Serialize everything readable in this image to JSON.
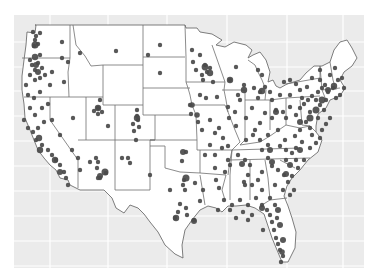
{
  "figure": {
    "type": "dot-density map",
    "region": "Contiguous United States",
    "background_color": "#ebebeb",
    "gridline_color": "#ffffff",
    "land_color": "#ffffff",
    "border_color": "#6e6e6e",
    "point_color": "#4a4a4a",
    "panel": {
      "x": 14,
      "y": 15,
      "width": 350,
      "height": 253
    },
    "grid_x": [
      50,
      108,
      167,
      227,
      287,
      343
    ],
    "grid_y": [
      42,
      67,
      91,
      116,
      141,
      166,
      191,
      216,
      241,
      266
    ]
  },
  "points": [
    [
      33,
      32
    ],
    [
      36,
      36
    ],
    [
      35,
      40
    ],
    [
      38,
      44
    ],
    [
      34,
      46
    ],
    [
      40,
      33
    ],
    [
      62,
      42
    ],
    [
      40,
      55
    ],
    [
      30,
      60
    ],
    [
      32,
      65
    ],
    [
      35,
      70
    ],
    [
      38,
      63
    ],
    [
      42,
      68
    ],
    [
      30,
      75
    ],
    [
      35,
      80
    ],
    [
      40,
      78
    ],
    [
      45,
      75
    ],
    [
      52,
      72
    ],
    [
      50,
      85
    ],
    [
      64,
      82
    ],
    [
      68,
      62
    ],
    [
      80,
      53
    ],
    [
      116,
      51
    ],
    [
      160,
      45
    ],
    [
      62,
      58
    ],
    [
      26,
      85
    ],
    [
      28,
      95
    ],
    [
      34,
      98
    ],
    [
      40,
      92
    ],
    [
      30,
      108
    ],
    [
      35,
      115
    ],
    [
      42,
      108
    ],
    [
      48,
      104
    ],
    [
      52,
      120
    ],
    [
      60,
      135
    ],
    [
      24,
      120
    ],
    [
      28,
      128
    ],
    [
      33,
      132
    ],
    [
      38,
      128
    ],
    [
      36,
      140
    ],
    [
      42,
      145
    ],
    [
      48,
      150
    ],
    [
      52,
      155
    ],
    [
      56,
      160
    ],
    [
      60,
      165
    ],
    [
      64,
      172
    ],
    [
      66,
      178
    ],
    [
      68,
      185
    ],
    [
      44,
      122
    ],
    [
      72,
      150
    ],
    [
      78,
      158
    ],
    [
      80,
      170
    ],
    [
      90,
      162
    ],
    [
      96,
      158
    ],
    [
      98,
      162
    ],
    [
      97,
      168
    ],
    [
      100,
      178
    ],
    [
      106,
      173
    ],
    [
      98,
      108
    ],
    [
      100,
      100
    ],
    [
      98,
      114
    ],
    [
      102,
      112
    ],
    [
      94,
      111
    ],
    [
      73,
      118
    ],
    [
      108,
      126
    ],
    [
      137,
      110
    ],
    [
      137,
      116
    ],
    [
      138,
      120
    ],
    [
      133,
      124
    ],
    [
      139,
      127
    ],
    [
      134,
      131
    ],
    [
      136,
      140
    ],
    [
      130,
      163
    ],
    [
      128,
      158
    ],
    [
      122,
      158
    ],
    [
      98,
      178
    ],
    [
      148,
      55
    ],
    [
      192,
      50
    ],
    [
      200,
      55
    ],
    [
      193,
      62
    ],
    [
      205,
      65
    ],
    [
      210,
      68
    ],
    [
      207,
      72
    ],
    [
      202,
      75
    ],
    [
      196,
      70
    ],
    [
      203,
      80
    ],
    [
      213,
      82
    ],
    [
      200,
      95
    ],
    [
      206,
      98
    ],
    [
      217,
      97
    ],
    [
      190,
      105
    ],
    [
      191,
      114
    ],
    [
      198,
      122
    ],
    [
      202,
      130
    ],
    [
      210,
      120
    ],
    [
      215,
      133
    ],
    [
      223,
      138
    ],
    [
      219,
      128
    ],
    [
      230,
      80
    ],
    [
      236,
      67
    ],
    [
      244,
      85
    ],
    [
      238,
      95
    ],
    [
      240,
      100
    ],
    [
      228,
      107
    ],
    [
      235,
      112
    ],
    [
      229,
      118
    ],
    [
      236,
      126
    ],
    [
      246,
      140
    ],
    [
      253,
      135
    ],
    [
      246,
      118
    ],
    [
      252,
      108
    ],
    [
      258,
      98
    ],
    [
      254,
      88
    ],
    [
      260,
      92
    ],
    [
      265,
      87
    ],
    [
      270,
      92
    ],
    [
      258,
      70
    ],
    [
      262,
      75
    ],
    [
      272,
      100
    ],
    [
      280,
      95
    ],
    [
      276,
      110
    ],
    [
      265,
      113
    ],
    [
      272,
      118
    ],
    [
      260,
      123
    ],
    [
      255,
      130
    ],
    [
      283,
      112
    ],
    [
      286,
      118
    ],
    [
      290,
      107
    ],
    [
      296,
      115
    ],
    [
      300,
      108
    ],
    [
      304,
      104
    ],
    [
      308,
      100
    ],
    [
      312,
      96
    ],
    [
      318,
      92
    ],
    [
      322,
      88
    ],
    [
      325,
      85
    ],
    [
      328,
      92
    ],
    [
      333,
      88
    ],
    [
      338,
      80
    ],
    [
      340,
      95
    ],
    [
      316,
      100
    ],
    [
      320,
      105
    ],
    [
      324,
      110
    ],
    [
      310,
      112
    ],
    [
      306,
      122
    ],
    [
      300,
      130
    ],
    [
      295,
      136
    ],
    [
      310,
      128
    ],
    [
      312,
      135
    ],
    [
      302,
      142
    ],
    [
      296,
      148
    ],
    [
      292,
      153
    ],
    [
      286,
      150
    ],
    [
      280,
      146
    ],
    [
      268,
      145
    ],
    [
      262,
      150
    ],
    [
      268,
      158
    ],
    [
      272,
      166
    ],
    [
      278,
      170
    ],
    [
      284,
      175
    ],
    [
      288,
      182
    ],
    [
      292,
      176
    ],
    [
      298,
      168
    ],
    [
      304,
      160
    ],
    [
      296,
      160
    ],
    [
      286,
      160
    ],
    [
      310,
      148
    ],
    [
      316,
      143
    ],
    [
      320,
      138
    ],
    [
      322,
      130
    ],
    [
      326,
      124
    ],
    [
      330,
      118
    ],
    [
      318,
      118
    ],
    [
      296,
      84
    ],
    [
      300,
      90
    ],
    [
      307,
      87
    ],
    [
      290,
      80
    ],
    [
      284,
      82
    ],
    [
      320,
      70
    ],
    [
      330,
      75
    ],
    [
      335,
      68
    ],
    [
      342,
      78
    ],
    [
      344,
      88
    ],
    [
      312,
      78
    ],
    [
      160,
      73
    ],
    [
      182,
      161
    ],
    [
      186,
      152
    ],
    [
      184,
      180
    ],
    [
      183,
      185
    ],
    [
      195,
      183
    ],
    [
      180,
      204
    ],
    [
      178,
      212
    ],
    [
      175,
      218
    ],
    [
      186,
      208
    ],
    [
      187,
      215
    ],
    [
      194,
      220
    ],
    [
      200,
      201
    ],
    [
      203,
      190
    ],
    [
      215,
      168
    ],
    [
      216,
      180
    ],
    [
      219,
      188
    ],
    [
      225,
      172
    ],
    [
      230,
      165
    ],
    [
      238,
      155
    ],
    [
      245,
      160
    ],
    [
      250,
      165
    ],
    [
      248,
      175
    ],
    [
      244,
      182
    ],
    [
      252,
      185
    ],
    [
      258,
      180
    ],
    [
      262,
      190
    ],
    [
      256,
      198
    ],
    [
      248,
      205
    ],
    [
      240,
      200
    ],
    [
      232,
      205
    ],
    [
      224,
      200
    ],
    [
      218,
      210
    ],
    [
      230,
      210
    ],
    [
      236,
      218
    ],
    [
      243,
      212
    ],
    [
      262,
      205
    ],
    [
      270,
      198
    ],
    [
      275,
      205
    ],
    [
      270,
      215
    ],
    [
      272,
      222
    ],
    [
      274,
      230
    ],
    [
      276,
      238
    ],
    [
      278,
      244
    ],
    [
      280,
      250
    ],
    [
      283,
      256
    ],
    [
      281,
      262
    ],
    [
      267,
      210
    ],
    [
      228,
      160
    ],
    [
      170,
      190
    ],
    [
      185,
      190
    ],
    [
      150,
      175
    ],
    [
      215,
      155
    ],
    [
      210,
      145
    ],
    [
      222,
      148
    ],
    [
      228,
      146
    ],
    [
      205,
      155
    ],
    [
      320,
      80
    ],
    [
      326,
      100
    ],
    [
      336,
      98
    ],
    [
      302,
      98
    ],
    [
      290,
      95
    ],
    [
      285,
      140
    ],
    [
      278,
      130
    ],
    [
      268,
      135
    ],
    [
      260,
      140
    ],
    [
      262,
      172
    ],
    [
      275,
      185
    ],
    [
      283,
      190
    ],
    [
      290,
      195
    ],
    [
      294,
      190
    ],
    [
      245,
      185
    ],
    [
      252,
      215
    ],
    [
      248,
      220
    ],
    [
      277,
      218
    ],
    [
      263,
      230
    ]
  ],
  "big_points": [
    [
      35,
      45,
      3.5
    ],
    [
      35,
      57,
      3.2
    ],
    [
      36,
      65,
      3
    ],
    [
      38,
      72,
      3
    ],
    [
      39,
      138,
      3.2
    ],
    [
      40,
      150,
      3.2
    ],
    [
      55,
      160,
      3.2
    ],
    [
      60,
      172,
      3
    ],
    [
      98,
      108,
      3.2
    ],
    [
      100,
      176,
      3
    ],
    [
      105,
      172,
      3.5
    ],
    [
      137,
      118,
      3.2
    ],
    [
      205,
      67,
      3.4
    ],
    [
      210,
      73,
      3.2
    ],
    [
      192,
      105,
      2.8
    ],
    [
      197,
      115,
      2.8
    ],
    [
      244,
      90,
      3.2
    ],
    [
      262,
      91,
      3.2
    ],
    [
      186,
      178,
      3.5
    ],
    [
      183,
      152,
      3
    ],
    [
      176,
      218,
      3.2
    ],
    [
      194,
      221,
      3
    ],
    [
      276,
      112,
      3
    ],
    [
      300,
      122,
      3
    ],
    [
      310,
      118,
      3.5
    ],
    [
      316,
      110,
      3.5
    ],
    [
      322,
      100,
      3.4
    ],
    [
      328,
      90,
      3
    ],
    [
      334,
      86,
      3.2
    ],
    [
      300,
      150,
      3
    ],
    [
      290,
      165,
      3
    ],
    [
      286,
      174,
      3
    ],
    [
      270,
      150,
      3
    ],
    [
      272,
      162,
      3
    ],
    [
      278,
      210,
      3
    ],
    [
      280,
      225,
      3
    ],
    [
      283,
      240,
      3
    ],
    [
      282,
      252,
      2.8
    ],
    [
      230,
      80,
      3.2
    ],
    [
      242,
      164,
      3
    ],
    [
      262,
      208,
      3
    ]
  ]
}
